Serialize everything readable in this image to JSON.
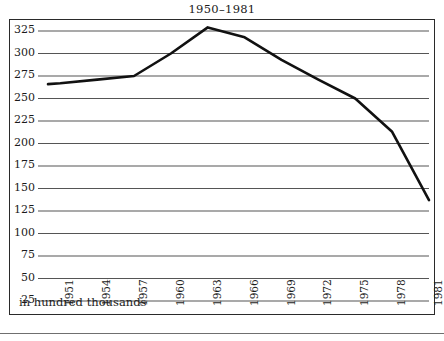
{
  "figure": {
    "title": "1950–1981",
    "caption": "in hundred thousands",
    "frame_color": "#2a2a2a",
    "grid_color": "#555555",
    "line_color": "#111111"
  },
  "chart_data": {
    "type": "line",
    "title": "1950–1981",
    "xlabel": "in hundred thousands",
    "ylabel": "",
    "ylim": [
      25,
      335
    ],
    "xlim": [
      1950,
      1981
    ],
    "grid": true,
    "legend": "none",
    "y_ticks": [
      25,
      50,
      75,
      100,
      125,
      150,
      175,
      200,
      225,
      250,
      275,
      300,
      325
    ],
    "x_ticks": [
      1951,
      1954,
      1957,
      1960,
      1963,
      1966,
      1969,
      1972,
      1975,
      1978,
      1981
    ],
    "x": [
      1950,
      1951,
      1954,
      1957,
      1960,
      1963,
      1966,
      1969,
      1972,
      1975,
      1978,
      1981
    ],
    "values": [
      266,
      267,
      271,
      275,
      300,
      329,
      318,
      293,
      271,
      250,
      213,
      137
    ],
    "series": [
      {
        "name": "population",
        "values": [
          266,
          267,
          271,
          275,
          300,
          329,
          318,
          293,
          271,
          250,
          213,
          137
        ]
      }
    ]
  }
}
